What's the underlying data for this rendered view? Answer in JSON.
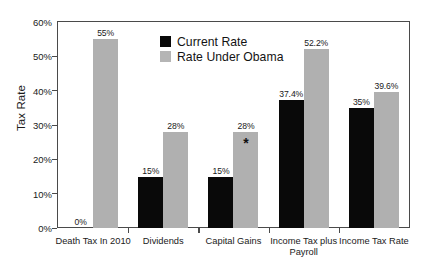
{
  "chart_data": {
    "type": "bar",
    "title": "",
    "xlabel": "",
    "ylabel": "Tax Rate",
    "ylim": [
      0,
      60
    ],
    "ytick_labels": [
      "0%",
      "10%",
      "20%",
      "30%",
      "40%",
      "50%",
      "60%"
    ],
    "ytick_values": [
      0,
      10,
      20,
      30,
      40,
      50,
      60
    ],
    "grid": false,
    "legend_position": "inside-top-center",
    "categories": [
      "Death Tax In 2010",
      "Dividends",
      "Capital Gains",
      "Income Tax plus Payroll",
      "Income Tax Rate"
    ],
    "series": [
      {
        "name": "Current Rate",
        "color": "#090909",
        "values": [
          0,
          15,
          15,
          37.4,
          35
        ],
        "labels": [
          "0%",
          "15%",
          "15%",
          "37.4%",
          "35%"
        ]
      },
      {
        "name": "Rate Under Obama",
        "color": "#b0b0b0",
        "values": [
          55,
          28,
          28,
          52.2,
          39.6
        ],
        "labels": [
          "55%",
          "28%",
          "28%",
          "52.2%",
          "39.6%"
        ]
      }
    ],
    "annotations": [
      {
        "text": "*",
        "category": "Capital Gains",
        "series": "Rate Under Obama",
        "note": "asterisk marker inside top of Capital Gains Obama bar"
      }
    ]
  },
  "categories_display": [
    {
      "line1": "Death Tax In 2010",
      "line2": ""
    },
    {
      "line1": "Dividends",
      "line2": ""
    },
    {
      "line1": "Capital Gains",
      "line2": ""
    },
    {
      "line1": "Income Tax plus",
      "line2": "Payroll"
    },
    {
      "line1": "Income Tax Rate",
      "line2": ""
    }
  ],
  "legend": {
    "items": [
      {
        "label": "Current Rate",
        "color": "#090909"
      },
      {
        "label": "Rate Under Obama",
        "color": "#b5b5b5"
      }
    ]
  }
}
